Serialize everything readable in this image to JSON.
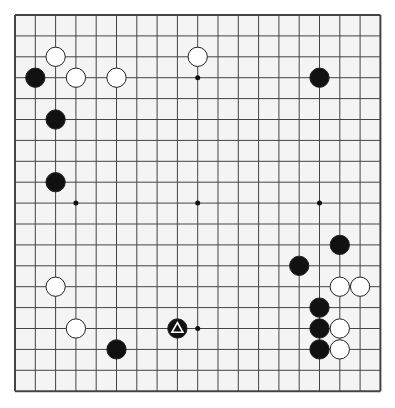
{
  "board": {
    "size": 19,
    "origin_x": 15,
    "origin_y": 15,
    "cell_w": 20.3,
    "cell_h": 20.9,
    "line_color": "#444444",
    "background": "#f4f4f4",
    "hoshi": [
      [
        3,
        3
      ],
      [
        9,
        3
      ],
      [
        15,
        3
      ],
      [
        3,
        9
      ],
      [
        9,
        9
      ],
      [
        15,
        9
      ],
      [
        3,
        15
      ],
      [
        9,
        15
      ],
      [
        15,
        15
      ]
    ]
  },
  "stones": [
    {
      "color": "white",
      "col": 2,
      "row": 2
    },
    {
      "color": "black",
      "col": 1,
      "row": 3
    },
    {
      "color": "white",
      "col": 3,
      "row": 3
    },
    {
      "color": "white",
      "col": 5,
      "row": 3
    },
    {
      "color": "white",
      "col": 9,
      "row": 2
    },
    {
      "color": "black",
      "col": 15,
      "row": 3
    },
    {
      "color": "black",
      "col": 2,
      "row": 5
    },
    {
      "color": "black",
      "col": 2,
      "row": 8
    },
    {
      "color": "black",
      "col": 16,
      "row": 11
    },
    {
      "color": "black",
      "col": 14,
      "row": 12
    },
    {
      "color": "white",
      "col": 2,
      "row": 13
    },
    {
      "color": "white",
      "col": 16,
      "row": 13
    },
    {
      "color": "white",
      "col": 17,
      "row": 13
    },
    {
      "color": "black",
      "col": 15,
      "row": 14
    },
    {
      "color": "white",
      "col": 3,
      "row": 15
    },
    {
      "color": "black",
      "col": 8,
      "row": 15,
      "marker": "triangle"
    },
    {
      "color": "black",
      "col": 15,
      "row": 15
    },
    {
      "color": "white",
      "col": 16,
      "row": 15
    },
    {
      "color": "black",
      "col": 5,
      "row": 16
    },
    {
      "color": "black",
      "col": 15,
      "row": 16
    },
    {
      "color": "white",
      "col": 16,
      "row": 16
    }
  ]
}
